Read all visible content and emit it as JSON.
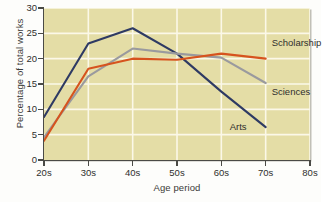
{
  "chart_data": {
    "type": "line",
    "title": "",
    "xlabel": "Age period",
    "ylabel": "Percentage of total works",
    "categories": [
      "20s",
      "30s",
      "40s",
      "50s",
      "60s",
      "70s",
      "80s"
    ],
    "x_tick_labels": [
      "20s",
      "30s",
      "40s",
      "50s",
      "60s",
      "70s",
      "80s"
    ],
    "y_tick_labels": [
      "0",
      "5",
      "10",
      "15",
      "20",
      "25",
      "30"
    ],
    "y_ticks": [
      0,
      5,
      10,
      15,
      20,
      25,
      30
    ],
    "ylim": [
      0,
      30
    ],
    "xlim": [
      0,
      6
    ],
    "grid": "white gridlines on horizontal and vertical ticks",
    "legend": "inline series labels at right end of each line",
    "plot_background": "#e4dda6",
    "series": [
      {
        "name": "Arts",
        "color": "#2e3a63",
        "label_position": "below-right-of-line-end",
        "x": [
          "20s",
          "30s",
          "40s",
          "50s",
          "60s",
          "70s"
        ],
        "values": [
          8.5,
          23.0,
          26.0,
          21.0,
          13.5,
          6.5
        ]
      },
      {
        "name": "Sciences",
        "color": "#9a9a9e",
        "label_position": "right-of-line-end",
        "x": [
          "20s",
          "30s",
          "40s",
          "50s",
          "60s",
          "70s"
        ],
        "values": [
          4.5,
          16.5,
          22.0,
          21.0,
          20.2,
          15.2
        ]
      },
      {
        "name": "Scholarship",
        "color": "#d6531e",
        "label_position": "above-right-of-line-end",
        "x": [
          "20s",
          "30s",
          "40s",
          "50s",
          "60s",
          "70s"
        ],
        "values": [
          3.8,
          18.0,
          20.0,
          19.8,
          21.0,
          20.0
        ]
      }
    ],
    "annotations": [
      {
        "text": "Scholarship",
        "series": "Scholarship"
      },
      {
        "text": "Sciences",
        "series": "Sciences"
      },
      {
        "text": "Arts",
        "series": "Arts"
      }
    ]
  }
}
